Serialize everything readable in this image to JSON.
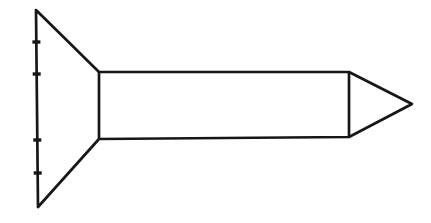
{
  "figure": {
    "name": "countersunk-flat-head-screw-side-view",
    "canvas": {
      "width": 431,
      "height": 223,
      "background": "#ffffff"
    },
    "stroke": {
      "color": "#171717",
      "width": 2.7
    },
    "outline": {
      "name": "screw-silhouette",
      "points": [
        [
          36,
          10
        ],
        [
          99,
          72
        ],
        [
          349,
          72
        ],
        [
          412,
          104
        ],
        [
          349,
          137
        ],
        [
          99,
          139
        ],
        [
          38,
          207
        ]
      ]
    },
    "internal_lines": [
      {
        "name": "head-shank-boundary-line",
        "points": [
          [
            99,
            72
          ],
          [
            99,
            139
          ]
        ]
      },
      {
        "name": "shank-tip-boundary-line",
        "points": [
          [
            349,
            72
          ],
          [
            349,
            137
          ]
        ]
      }
    ],
    "tick_marks": {
      "name": "head-edge-division-tick",
      "length": 8,
      "thickness": 3.4,
      "positions": [
        [
          36.4,
          42
        ],
        [
          36.7,
          74
        ],
        [
          37.3,
          140
        ],
        [
          37.7,
          173
        ]
      ]
    }
  }
}
